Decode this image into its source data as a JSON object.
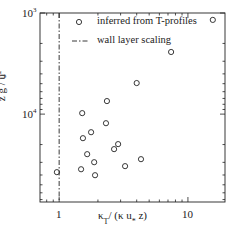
{
  "chart_data": {
    "type": "scatter",
    "title": "",
    "xlabel": "κ_T / (κ u_* z)",
    "ylabel": "z g / u_*^2",
    "x_scale": "log",
    "y_scale": "log",
    "y_inverted": true,
    "xlim": [
      0.71,
      19.4
    ],
    "ylim": [
      1000,
      74000
    ],
    "x_ticks": [
      {
        "value": 1,
        "label": "1"
      },
      {
        "value": 10,
        "label": "10"
      }
    ],
    "y_ticks": [
      {
        "value": 1000,
        "label": "10",
        "exp": "3"
      },
      {
        "value": 10000,
        "label": "10",
        "exp": "4"
      }
    ],
    "grid": false,
    "legend_position": "upper-right-inside",
    "series": [
      {
        "name": "inferred from T-profiles",
        "marker": "open-circle",
        "points": [
          {
            "x": 15.6,
            "y": 1170
          },
          {
            "x": 7.4,
            "y": 2430
          },
          {
            "x": 4.0,
            "y": 4930
          },
          {
            "x": 2.35,
            "y": 7430
          },
          {
            "x": 1.51,
            "y": 9780
          },
          {
            "x": 2.31,
            "y": 12300
          },
          {
            "x": 1.77,
            "y": 15100
          },
          {
            "x": 1.53,
            "y": 17300
          },
          {
            "x": 2.87,
            "y": 19800
          },
          {
            "x": 2.67,
            "y": 22200
          },
          {
            "x": 1.65,
            "y": 24900
          },
          {
            "x": 1.87,
            "y": 29900
          },
          {
            "x": 4.32,
            "y": 27900
          },
          {
            "x": 3.25,
            "y": 32700
          },
          {
            "x": 1.48,
            "y": 35100
          },
          {
            "x": 0.96,
            "y": 37500
          },
          {
            "x": 1.9,
            "y": 40200
          }
        ]
      },
      {
        "name": "wall layer scaling",
        "line_style": "dash-dot",
        "x_constant": 1
      }
    ]
  },
  "labels": {
    "x_axis_main": "κ",
    "x_axis_sub": "T",
    "x_axis_rest": "/ (κ u",
    "x_axis_sub2": "*",
    "x_axis_end": " z)",
    "y_axis": "z g / u",
    "y_axis_sup": "2",
    "y_axis_sub": "*",
    "legend_circle": "inferred from T-profiles",
    "legend_line": "wall layer scaling",
    "xtick_1": "1",
    "xtick_10": "10",
    "ytick_base": "10",
    "ytick_exp3": "3",
    "ytick_exp4": "4"
  },
  "colors": {
    "ink": "#222222",
    "background": "#ffffff"
  }
}
